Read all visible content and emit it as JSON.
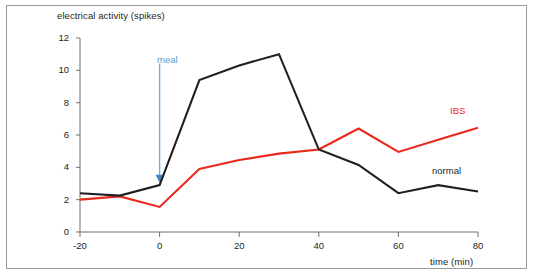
{
  "chart_data": {
    "type": "line",
    "title": "",
    "xlabel": "time (min)",
    "ylabel": "electrical activity (spikes)",
    "xlim": [
      -20,
      80
    ],
    "ylim": [
      0,
      12
    ],
    "xticks": [
      -20,
      0,
      20,
      40,
      60,
      80
    ],
    "yticks": [
      0,
      2,
      4,
      6,
      8,
      10,
      12
    ],
    "xtick_labels": [
      "-20",
      "0",
      "20",
      "40",
      "60",
      "80"
    ],
    "ytick_labels": [
      "0",
      "2",
      "4",
      "6",
      "8",
      "10",
      "12"
    ],
    "grid": false,
    "legend_position": "inline-end-of-line",
    "x": [
      -20,
      -10,
      0,
      10,
      20,
      30,
      40,
      50,
      60,
      70,
      80
    ],
    "series": [
      {
        "name": "normal",
        "color": "#231f20",
        "values": [
          2.4,
          2.25,
          2.9,
          9.4,
          10.3,
          11.0,
          5.1,
          4.15,
          2.4,
          2.9,
          2.5
        ]
      },
      {
        "name": "IBS",
        "color": "#e8291c",
        "values": [
          2.0,
          2.2,
          1.55,
          3.9,
          4.45,
          4.85,
          5.1,
          6.4,
          4.95,
          5.7,
          6.45
        ]
      }
    ],
    "annotations": [
      {
        "text": "meal",
        "x": 0,
        "y_text": 10.3,
        "y_arrow_tip": 3.05,
        "color": "#5b9bd5",
        "kind": "down-arrow"
      }
    ]
  },
  "axis_titles": {
    "y": "electrical activity (spikes)",
    "x": "time (min)"
  },
  "series_labels": {
    "ibs": "IBS",
    "normal": "normal"
  },
  "annotation_labels": {
    "meal": "meal"
  },
  "colors": {
    "ibs": "#e8291c",
    "normal": "#231f20",
    "meal_arrow": "#5b9bd5",
    "axis": "#6f6f6f",
    "frame": "#9a9a9a",
    "background": "#ffffff"
  }
}
